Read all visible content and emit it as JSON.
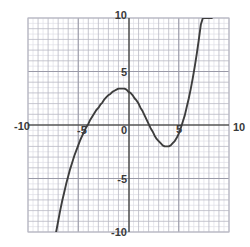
{
  "chart_data": {
    "type": "line",
    "title": "",
    "subtitle": "",
    "xlabel": "",
    "ylabel": "",
    "xlim": [
      -10,
      10
    ],
    "ylim": [
      -10,
      10
    ],
    "grid": true,
    "grid_major_step": 1,
    "grid_minor_step": 0.5,
    "legend": null,
    "legend_position": "none",
    "axis_color": "#555555",
    "grid_major_color": "#b9b9c4",
    "grid_minor_color": "#dedee5",
    "curve_color": "#3d3d3d",
    "background_color": "#ffffff",
    "x_tick_labels": [
      "-10",
      "-5",
      "0",
      "10"
    ],
    "y_tick_labels": [
      "10",
      "5",
      "-5",
      "-10"
    ],
    "x_ticks": [
      -10,
      -5,
      0,
      10
    ],
    "y_ticks": [
      10,
      5,
      -5,
      -10
    ],
    "inline_labels": [
      "5"
    ],
    "annotations": [],
    "series": [
      {
        "name": "cubic",
        "expression": "0.1(x+4.7)(x-1.3)(x-5.1)",
        "roots": [
          -4.7,
          1.3,
          5.1
        ],
        "local_maximum": [
          -1.6,
          3.5
        ],
        "local_minimum": [
          3.8,
          -1.3
        ],
        "y_intercept": 3.1,
        "enters_plot_at": [
          -7.2,
          -10
        ],
        "exits_plot_at": [
          8.3,
          10
        ],
        "x": [
          -7.2,
          -7.0,
          -6.8,
          -6.6,
          -6.4,
          -6.2,
          -6.0,
          -5.8,
          -5.6,
          -5.4,
          -5.2,
          -5.0,
          -4.8,
          -4.6,
          -4.4,
          -4.2,
          -4.0,
          -3.8,
          -3.6,
          -3.4,
          -3.2,
          -3.0,
          -2.8,
          -2.6,
          -2.4,
          -2.2,
          -2.0,
          -1.8,
          -1.6,
          -1.4,
          -1.2,
          -1.0,
          -0.8,
          -0.6,
          -0.4,
          -0.2,
          0.0,
          0.2,
          0.4,
          0.6,
          0.8,
          1.0,
          1.2,
          1.4,
          1.6,
          1.8,
          2.0,
          2.2,
          2.4,
          2.6,
          2.8,
          3.0,
          3.2,
          3.4,
          3.6,
          3.8,
          4.0,
          4.2,
          4.4,
          4.6,
          4.8,
          5.0,
          5.2,
          5.4,
          5.6,
          5.8,
          6.0,
          6.2,
          6.4,
          6.6,
          6.8,
          7.0,
          7.2,
          7.4,
          7.6,
          7.8,
          8.0,
          8.2,
          8.3
        ],
        "y": [
          -10.0,
          -9.0,
          -8.0,
          -7.1,
          -6.3,
          -5.5,
          -4.8,
          -4.1,
          -3.5,
          -2.9,
          -2.4,
          -1.9,
          -1.4,
          -1.0,
          -0.6,
          -0.2,
          0.1,
          0.5,
          0.8,
          1.1,
          1.4,
          1.6,
          1.9,
          2.1,
          2.4,
          2.6,
          2.8,
          2.9,
          3.1,
          3.2,
          3.3,
          3.4,
          3.4,
          3.4,
          3.4,
          3.3,
          3.1,
          3.0,
          2.8,
          2.5,
          2.3,
          2.0,
          1.6,
          1.3,
          0.9,
          0.5,
          0.1,
          -0.3,
          -0.6,
          -1.0,
          -1.3,
          -1.5,
          -1.7,
          -1.9,
          -2.0,
          -2.0,
          -2.0,
          -1.9,
          -1.7,
          -1.5,
          -1.2,
          -0.8,
          -0.3,
          0.3,
          0.9,
          1.7,
          2.5,
          3.4,
          4.4,
          5.5,
          6.7,
          8.0,
          9.4,
          10.0,
          10.0,
          10.0,
          10.0,
          10.0,
          10.0
        ]
      }
    ]
  },
  "tick_positions": {
    "x_neg10": {
      "label": "-10",
      "px": 14,
      "py": 130
    },
    "x_neg5": {
      "label": "-5",
      "px": 77,
      "py": 134
    },
    "x_zero": {
      "label": "0",
      "px": 121,
      "py": 134
    },
    "x_pos10": {
      "label": "10",
      "px": 236,
      "py": 131
    },
    "y_pos10": {
      "label": "10",
      "px": 121,
      "py": 15
    },
    "y_pos5": {
      "label": "5",
      "px": 124,
      "py": 72
    },
    "y_inline5": {
      "label": "5",
      "px": 176,
      "py": 133
    },
    "y_neg5": {
      "label": "-5",
      "px": 121,
      "py": 179
    },
    "y_neg10": {
      "label": "-10",
      "px": 118,
      "py": 231
    }
  }
}
